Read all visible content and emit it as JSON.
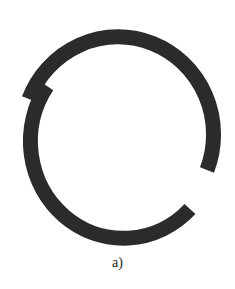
{
  "figure": {
    "caption": "a)",
    "stroke_color": "#2b2b2b",
    "stroke_width": 15
  }
}
